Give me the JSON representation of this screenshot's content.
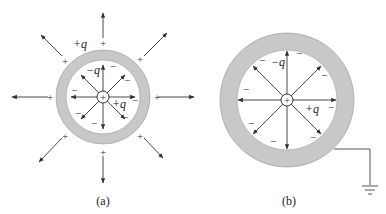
{
  "figure": {
    "panels": [
      {
        "id": "a",
        "caption": "(a)",
        "outer_charge_label": "+q",
        "inner_charge_label": "−q",
        "center_charge_label": "+q",
        "center_symbol": "+",
        "outer_surface_sign": "+",
        "inner_surface_sign": "−",
        "grounded": false
      },
      {
        "id": "b",
        "caption": "(b)",
        "inner_charge_label": "−q",
        "center_charge_label": "+q",
        "center_symbol": "+",
        "inner_surface_sign": "−",
        "grounded": true
      }
    ],
    "colors": {
      "shell_fill": "#c8c8c8",
      "line": "#333333",
      "background": "#ffffff"
    }
  }
}
